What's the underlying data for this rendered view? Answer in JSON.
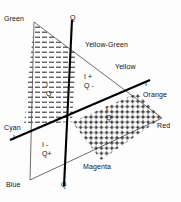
{
  "diagram": {
    "hue_labels": [
      {
        "id": "green",
        "text": "Green",
        "x": 4,
        "y": 15
      },
      {
        "id": "yellow-green",
        "text": "Yellow-Green",
        "x": 85,
        "y": 41
      },
      {
        "id": "yellow",
        "text": "Yellow",
        "x": 115,
        "y": 63
      },
      {
        "id": "orange",
        "text": "Orange",
        "x": 143,
        "y": 91
      },
      {
        "id": "red",
        "text": "Red",
        "x": 157,
        "y": 122
      },
      {
        "id": "magenta",
        "text": "Magenta",
        "x": 83,
        "y": 163
      },
      {
        "id": "blue",
        "text": "Blue",
        "x": 6,
        "y": 181
      },
      {
        "id": "cyan",
        "text": "Cyan",
        "x": 4,
        "y": 124
      }
    ],
    "axis_labels": [
      {
        "id": "q-top",
        "text": "Q",
        "x": 70,
        "y": 14
      },
      {
        "id": "q-bottom",
        "text": "Q",
        "x": 61,
        "y": 181
      },
      {
        "id": "i-right",
        "text": "I",
        "x": 145,
        "y": 80
      },
      {
        "id": "i-left",
        "text": "I",
        "x": 13,
        "y": 134
      }
    ],
    "quadrant_labels": [
      {
        "id": "i-minus-q-minus",
        "i": "I",
        "q": "Q",
        "x": 46,
        "y": 81
      },
      {
        "id": "i-plus-q-minus",
        "i": "I +",
        "q": "Q -",
        "x": 84,
        "y": 73
      },
      {
        "id": "i-plus-q-plus",
        "i": "I",
        "q": "Q",
        "x": 106,
        "y": 105
      },
      {
        "id": "i-minus-q-plus",
        "i": "I -",
        "q": "Q+",
        "x": 42,
        "y": 141
      }
    ],
    "colors": {
      "line": "#111111",
      "axis": "#000000",
      "hatch": "#222222",
      "text": "#111111",
      "background": "#fdfdfd"
    }
  }
}
